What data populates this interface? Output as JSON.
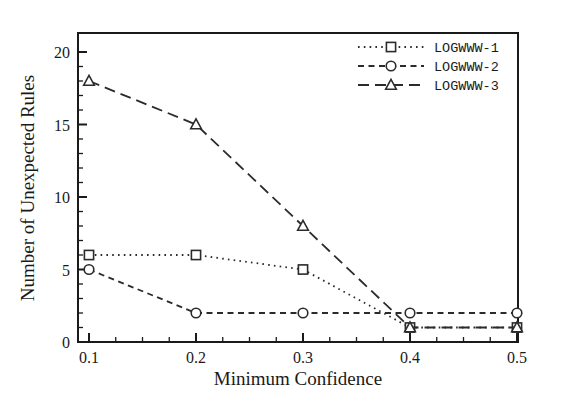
{
  "chart_data": {
    "type": "line",
    "title": "",
    "xlabel": "Minimum Confidence",
    "ylabel": "Number of Unexpected Rules",
    "x": [
      0.1,
      0.2,
      0.3,
      0.4,
      0.5
    ],
    "xtick_labels": [
      "0.1",
      "0.2",
      "0.3",
      "0.4",
      "0.5"
    ],
    "ytick_labels": [
      "0",
      "5",
      "10",
      "15",
      "20"
    ],
    "ytick_values": [
      0,
      5,
      10,
      15,
      20
    ],
    "xlim": [
      0.1,
      0.5
    ],
    "ylim": [
      0,
      21
    ],
    "grid": false,
    "legend_position": "top-right",
    "y_minor_tick_step": 1,
    "x_minor_tick_step": 0.025,
    "series": [
      {
        "name": "LOGWWW-1",
        "values": [
          6,
          6,
          5,
          1,
          1
        ],
        "marker": "square",
        "linestyle": "dotted",
        "color": "#2b2b2b"
      },
      {
        "name": "LOGWWW-2",
        "values": [
          5,
          2,
          2,
          2,
          2
        ],
        "marker": "circle",
        "linestyle": "dashed-short",
        "color": "#2b2b2b"
      },
      {
        "name": "LOGWWW-3",
        "values": [
          18,
          15,
          8,
          1,
          1
        ],
        "marker": "triangle",
        "linestyle": "dashed-long",
        "color": "#2b2b2b"
      }
    ]
  },
  "legend": {
    "entries": [
      {
        "label": "LOGWWW-1"
      },
      {
        "label": "LOGWWW-2"
      },
      {
        "label": "LOGWWW-3"
      }
    ]
  },
  "axes": {
    "x_title": "Minimum Confidence",
    "y_title": "Number of Unexpected Rules",
    "x_ticks": [
      "0.1",
      "0.2",
      "0.3",
      "0.4",
      "0.5"
    ],
    "y_ticks": [
      "0",
      "5",
      "10",
      "15",
      "20"
    ]
  }
}
